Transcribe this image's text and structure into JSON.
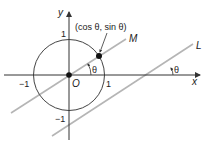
{
  "diagram": {
    "axes": {
      "x_label": "x",
      "y_label": "y",
      "origin_label": "O"
    },
    "ticks": {
      "x_pos": "1",
      "x_neg": "−1",
      "y_pos": "1",
      "y_neg": "−1"
    },
    "point_label": "(cos θ, sin θ)",
    "lines": {
      "m_label": "M",
      "l_label": "L"
    },
    "angles": {
      "at_origin": "θ",
      "at_l": "θ"
    },
    "colors": {
      "line_gray": "#b5b5b5",
      "axis": "#333333",
      "circle": "#444444"
    }
  }
}
